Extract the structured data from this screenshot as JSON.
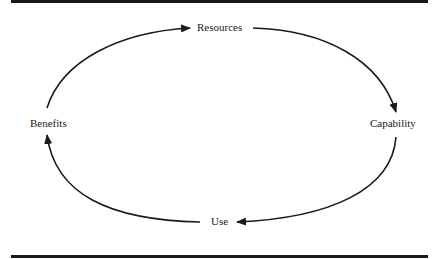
{
  "diagram": {
    "type": "cycle",
    "direction": "clockwise",
    "nodes": [
      {
        "id": "resources",
        "label": "Resources"
      },
      {
        "id": "capability",
        "label": "Capability"
      },
      {
        "id": "use",
        "label": "Use"
      },
      {
        "id": "benefits",
        "label": "Benefits"
      }
    ],
    "edges": [
      {
        "from": "resources",
        "to": "capability"
      },
      {
        "from": "capability",
        "to": "use"
      },
      {
        "from": "use",
        "to": "benefits"
      },
      {
        "from": "benefits",
        "to": "resources"
      }
    ],
    "colors": {
      "ink": "#1a1a1a",
      "background": "#ffffff"
    }
  }
}
